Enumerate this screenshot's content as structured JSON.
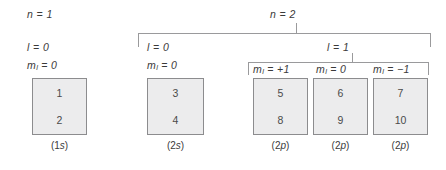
{
  "diagram": {
    "title_hidden": "",
    "shell_n1": {
      "n_label": "n = 1",
      "l_label": "l = 0",
      "ml_label": "m",
      "ml_sub": "l",
      "ml_value": " = 0"
    },
    "shell_n2": {
      "n_label": "n = 2",
      "subshell_s": {
        "l_label": "l = 0",
        "ml_label": "m",
        "ml_sub": "l",
        "ml_value": " = 0"
      },
      "subshell_p": {
        "l_label": "l = 1",
        "ml_cells": [
          {
            "label": "m",
            "sub": "l",
            "value": " = +1"
          },
          {
            "label": "m",
            "sub": "l",
            "value": " = 0"
          },
          {
            "label": "m",
            "sub": "l",
            "value": " = −1"
          }
        ]
      }
    },
    "orbitals": [
      {
        "top": "1",
        "bottom": "2",
        "caption_open": "(1",
        "caption_italic": "s",
        "caption_close": ")"
      },
      {
        "top": "3",
        "bottom": "4",
        "caption_open": "(2",
        "caption_italic": "s",
        "caption_close": ")"
      },
      {
        "top": "5",
        "bottom": "8",
        "caption_open": "(2",
        "caption_italic": "p",
        "caption_close": ")"
      },
      {
        "top": "6",
        "bottom": "9",
        "caption_open": "(2",
        "caption_italic": "p",
        "caption_close": ")"
      },
      {
        "top": "7",
        "bottom": "10",
        "caption_open": "(2",
        "caption_italic": "p",
        "caption_close": ")"
      }
    ],
    "colors": {
      "box_fill": "#ececed",
      "box_stroke": "#8c8c8e",
      "bracket_stroke": "#9a9a9c",
      "text": "#3a3a3a",
      "background": "#ffffff"
    }
  }
}
